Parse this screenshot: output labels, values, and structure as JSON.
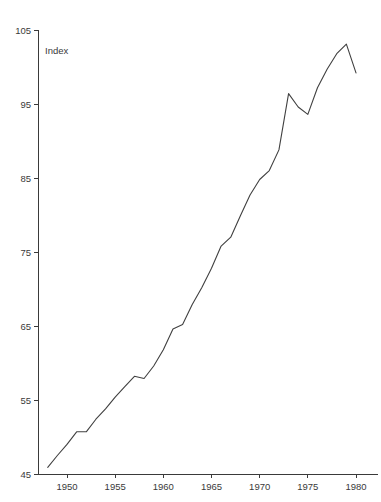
{
  "chart_data": {
    "type": "line",
    "title": "",
    "subtitle": "",
    "annotation": "Index",
    "xlabel": "",
    "ylabel": "",
    "xlim": [
      1948,
      1980.5
    ],
    "ylim": [
      45,
      105
    ],
    "grid": false,
    "legend": false,
    "x_ticks": [
      "1950",
      "1955",
      "1960",
      "1965",
      "1970",
      "1975",
      "1980"
    ],
    "x_tick_values": [
      1950,
      1955,
      1960,
      1965,
      1970,
      1975,
      1980
    ],
    "y_ticks": [
      "45",
      "55",
      "65",
      "75",
      "85",
      "95",
      "105"
    ],
    "y_tick_values": [
      45,
      55,
      65,
      75,
      85,
      95,
      105
    ],
    "line_color": "#404040",
    "axis_color": "#3a3a3a",
    "background_color": "#ffffff",
    "x": [
      1948,
      1949,
      1950,
      1951,
      1952,
      1953,
      1954,
      1955,
      1956,
      1957,
      1958,
      1959,
      1960,
      1961,
      1962,
      1963,
      1964,
      1965,
      1966,
      1967,
      1968,
      1969,
      1970,
      1971,
      1972,
      1973,
      1974,
      1975,
      1976,
      1977,
      1978,
      1979,
      1980
    ],
    "values": [
      45.9,
      47.5,
      49.0,
      50.7,
      50.7,
      52.4,
      53.8,
      55.4,
      56.8,
      58.2,
      57.9,
      59.6,
      61.8,
      64.6,
      65.2,
      67.9,
      70.2,
      72.8,
      75.8,
      77.0,
      79.9,
      82.7,
      84.8,
      86.0,
      88.8,
      96.4,
      94.6,
      93.6,
      97.2,
      99.7,
      101.8,
      103.1,
      99.2
    ],
    "series": [
      {
        "name": "Index",
        "values": [
          45.9,
          47.5,
          49.0,
          50.7,
          50.7,
          52.4,
          53.8,
          55.4,
          56.8,
          58.2,
          57.9,
          59.6,
          61.8,
          64.6,
          65.2,
          67.9,
          70.2,
          72.8,
          75.8,
          77.0,
          79.9,
          82.7,
          84.8,
          86.0,
          88.8,
          96.4,
          94.6,
          93.6,
          97.2,
          99.7,
          101.8,
          103.1,
          99.2
        ]
      }
    ]
  }
}
